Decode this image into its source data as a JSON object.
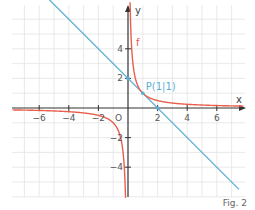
{
  "chart_data": {
    "type": "line",
    "title": "",
    "xlabel": "x",
    "ylabel": "y",
    "xlim": [
      -7.8,
      7.8
    ],
    "ylim": [
      -6,
      7
    ],
    "grid": true,
    "x_ticks": [
      -6,
      -4,
      -2,
      2,
      4,
      6
    ],
    "y_ticks": [
      4,
      2,
      -2,
      -4
    ],
    "x_tick_labels": [
      "−6",
      "−4",
      "−2",
      "2",
      "4",
      "6"
    ],
    "y_tick_labels": [
      "4",
      "2",
      "−2",
      "−4"
    ],
    "origin_label": "O",
    "series": [
      {
        "name": "f",
        "formula": "f(x) = 1/x",
        "color": "#e8604c",
        "label": "f",
        "points_sample": [
          [
            -7,
            -0.143
          ],
          [
            -4,
            -0.25
          ],
          [
            -2,
            -0.5
          ],
          [
            -1,
            -1
          ],
          [
            -0.5,
            -2
          ],
          [
            -0.2,
            -5
          ],
          [
            0.2,
            5
          ],
          [
            0.5,
            2
          ],
          [
            1,
            1
          ],
          [
            2,
            0.5
          ],
          [
            4,
            0.25
          ],
          [
            7,
            0.143
          ]
        ]
      },
      {
        "name": "tangent",
        "formula": "y = -x + 2",
        "color": "#5aaed3",
        "points_sample": [
          [
            -5.5,
            7.5
          ],
          [
            0,
            2
          ],
          [
            1,
            1
          ],
          [
            2,
            0
          ],
          [
            7.5,
            -5.5
          ]
        ]
      }
    ],
    "annotations": [
      {
        "text": "P(1|1)",
        "x": 1,
        "y": 1,
        "color": "#5aaed3"
      },
      {
        "text": "f",
        "x": 0.35,
        "y": 5.5,
        "color": "#e8604c"
      }
    ],
    "marked_points": [
      [
        0,
        2
      ],
      [
        1,
        1
      ],
      [
        2,
        0
      ]
    ]
  },
  "figure": {
    "caption": "Fig. 2",
    "function_label": "f",
    "point_label": "P(1|1)",
    "x_axis_label": "x",
    "y_axis_label": "y",
    "origin_label": "O",
    "colors": {
      "curve": "#e8604c",
      "line": "#5aaed3",
      "axis": "#333333",
      "grid": "#e3e3e3"
    }
  }
}
